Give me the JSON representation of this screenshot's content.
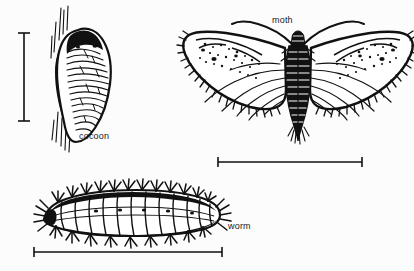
{
  "figure": {
    "background_color": "#fcfcfc",
    "ink_color": "#111111",
    "width": 414,
    "height": 271,
    "style": "black-and-white line drawing / scientific illustration"
  },
  "labels": {
    "cocoon": "cocoon",
    "moth": "moth",
    "worm": "worm"
  },
  "specimens": [
    {
      "name": "cocoon",
      "label": "cocoon",
      "description": "Silk cocoon spun on a twig, vertical oriented, ribbed and wrinkled surface",
      "scalebar": "vertical"
    },
    {
      "name": "moth",
      "label": "moth",
      "description": "Adult moth with wings spread, speckled forewings, fringed margins, dark segmented body, antennae curving upward",
      "scalebar": "horizontal"
    },
    {
      "name": "worm",
      "label": "worm",
      "description": "Hairy caterpillar / larva viewed from the side with tufts of bristles along the back",
      "scalebar": "horizontal"
    }
  ],
  "scalebars": [
    {
      "name": "cocoon-scalebar",
      "orientation": "vertical",
      "caption": ""
    },
    {
      "name": "moth-scalebar",
      "orientation": "horizontal",
      "caption": ""
    },
    {
      "name": "worm-scalebar",
      "orientation": "horizontal",
      "caption": ""
    }
  ]
}
